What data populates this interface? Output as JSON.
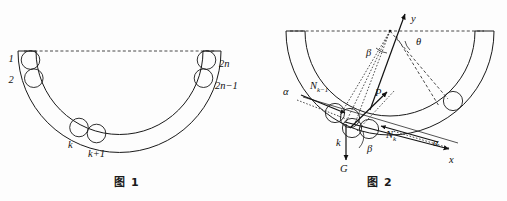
{
  "document": {
    "title": "Balls in a semicircular annular channel — force analysis figures"
  },
  "figure1": {
    "caption": "图 1",
    "labels": {
      "ball_first": "1",
      "ball_second": "2",
      "ball_last": "2n",
      "ball_second_last": "2n−1",
      "ball_k": "k",
      "ball_k_plus_1": "k+1"
    },
    "description": "Semicircular annular channel with a chain of 2n balls resting inside; top opening closed by a dashed horizontal diameter line."
  },
  "figure2": {
    "caption": "图 2",
    "labels": {
      "axis_y": "y",
      "axis_x": "x",
      "angle_theta": "θ",
      "angle_beta_top": "β",
      "angle_beta_bottom": "β",
      "angle_alpha_left": "α",
      "angle_alpha_right": "α",
      "force_p": "P",
      "force_g": "G",
      "normal_prev": "N",
      "normal_prev_sub": "k−1",
      "normal_cur": "N",
      "normal_cur_sub": "k",
      "ball_k": "k"
    },
    "description": "Free-body diagram of ball k inside the annular channel: weight G downward, contact forces N(k-1) and N(k) along the chain tangent, resultant P, local xy axes, angles alpha, beta and theta measured from the centre."
  },
  "style": {
    "ink": "#1a1a1a",
    "paper": "#fdfdfd"
  }
}
